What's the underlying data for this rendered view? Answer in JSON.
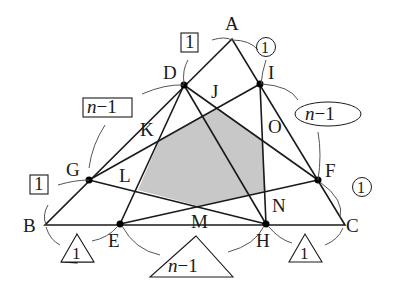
{
  "diagram": {
    "type": "triangle-geometry",
    "shaded_region": "hexagon JOMNLK",
    "shade_color": "#c8c8c8",
    "points": {
      "A": "A",
      "B": "B",
      "C": "C",
      "D": "D",
      "E": "E",
      "F": "F",
      "G": "G",
      "H": "H",
      "I": "I",
      "J": "J",
      "K": "K",
      "L": "L",
      "M": "M",
      "N": "N",
      "O": "O"
    },
    "ratio_labels": {
      "AD_square": "1",
      "DG_square": "n−1",
      "GB_square": "1",
      "AI_circle": "1",
      "IF_circle": "n−1",
      "FC_circle": "1",
      "BE_triangle": "1",
      "EH_triangle": "n−1",
      "HC_triangle": "1"
    }
  }
}
